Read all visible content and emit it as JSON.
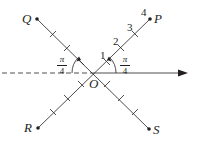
{
  "diagram": {
    "type": "polar-coordinate-lines",
    "origin": {
      "label": "O"
    },
    "points": [
      {
        "id": "P",
        "label": "P",
        "quadrant": "upper-right"
      },
      {
        "id": "Q",
        "label": "Q",
        "quadrant": "upper-left"
      },
      {
        "id": "R",
        "label": "R",
        "quadrant": "lower-left"
      },
      {
        "id": "S",
        "label": "S",
        "quadrant": "lower-right"
      }
    ],
    "scale_labels": [
      "1",
      "2",
      "3",
      "4"
    ],
    "angle_labels": [
      {
        "id": "right",
        "numerator": "π",
        "denominator": "4"
      },
      {
        "id": "left",
        "numerator": "π",
        "denominator": "4"
      }
    ],
    "polar_axis": {
      "style": "solid-arrow",
      "negative_extension": "dashed"
    },
    "colors": {
      "ink": "#231f20",
      "background": "#ffffff"
    }
  }
}
